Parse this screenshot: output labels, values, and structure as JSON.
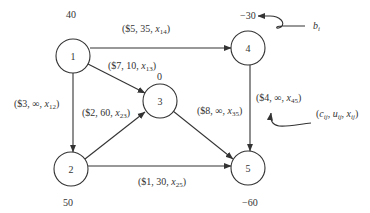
{
  "nodes": [
    {
      "id": "1",
      "label": "1",
      "supply": "40"
    },
    {
      "id": "2",
      "label": "2",
      "supply": "50"
    },
    {
      "id": "3",
      "label": "3",
      "supply": "0"
    },
    {
      "id": "4",
      "label": "4",
      "supply": "−30"
    },
    {
      "id": "5",
      "label": "5",
      "supply": "−60"
    }
  ],
  "edges": [
    {
      "from": "1",
      "to": "4",
      "cost": "$5",
      "cap": "35",
      "var": "x",
      "sub": "14"
    },
    {
      "from": "1",
      "to": "3",
      "cost": "$7",
      "cap": "10",
      "var": "x",
      "sub": "13"
    },
    {
      "from": "1",
      "to": "2",
      "cost": "$3",
      "cap": "∞",
      "var": "x",
      "sub": "12"
    },
    {
      "from": "2",
      "to": "3",
      "cost": "$2",
      "cap": "60",
      "var": "x",
      "sub": "23"
    },
    {
      "from": "3",
      "to": "5",
      "cost": "$8",
      "cap": "∞",
      "var": "x",
      "sub": "35"
    },
    {
      "from": "4",
      "to": "5",
      "cost": "$4",
      "cap": "∞",
      "var": "x",
      "sub": "45"
    },
    {
      "from": "2",
      "to": "5",
      "cost": "$1",
      "cap": "30",
      "var": "x",
      "sub": "25"
    }
  ],
  "legend": {
    "supply_label": "b",
    "supply_sub": "i",
    "arc_label": {
      "c": "c",
      "u": "u",
      "x": "x",
      "sub": "ij"
    }
  }
}
